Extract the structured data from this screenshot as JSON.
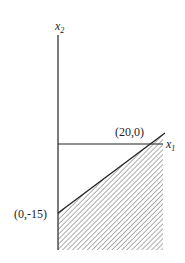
{
  "diagram": {
    "type": "feasible-region",
    "axes": {
      "x_label": "x",
      "x_subscript": "1",
      "y_label": "x",
      "y_subscript": "2"
    },
    "points": [
      {
        "label": "(20,0)",
        "x": 20,
        "y": 0
      },
      {
        "label": "(0,-15)",
        "x": 0,
        "y": -15
      }
    ],
    "region": {
      "description": "hatched region below line through (0,-15) and (20,0), right of x2 axis",
      "pattern": "diagonal-hatch"
    },
    "colors": {
      "line": "#222222",
      "background": "#ffffff"
    }
  }
}
